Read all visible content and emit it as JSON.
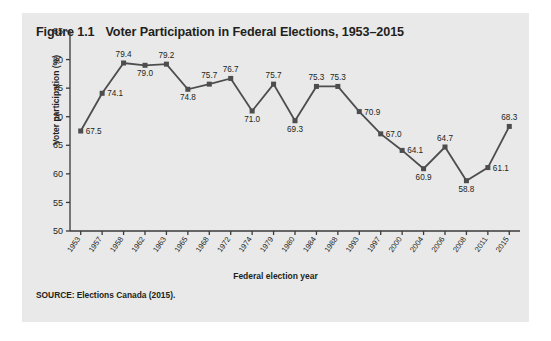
{
  "figure": {
    "number": "Figure 1.1",
    "title": "Voter Participation in Federal Elections, 1953–2015",
    "source_label": "SOURCE:",
    "source_text": "Elections Canada (2015)."
  },
  "chart_data": {
    "type": "line",
    "title": "Voter Participation in Federal Elections, 1953–2015",
    "subtitle": "",
    "xlabel": "Federal election year",
    "ylabel": "Voter participation (%)",
    "categories": [
      "1953",
      "1957",
      "1958",
      "1962",
      "1963",
      "1965",
      "1968",
      "1972",
      "1974",
      "1979",
      "1980",
      "1984",
      "1988",
      "1993",
      "1997",
      "2000",
      "2004",
      "2006",
      "2008",
      "2011",
      "2015"
    ],
    "values": [
      67.5,
      74.1,
      79.4,
      79.0,
      79.2,
      74.8,
      75.7,
      76.7,
      71.0,
      75.7,
      69.3,
      75.3,
      75.3,
      70.9,
      67.0,
      64.1,
      60.9,
      64.7,
      58.8,
      61.1,
      68.3
    ],
    "point_labels": [
      "67.5",
      "74.1",
      "79.4",
      "79.0",
      "79.2",
      "74.8",
      "75.7",
      "76.7",
      "71.0",
      "75.7",
      "69.3",
      "75.3",
      "75.3",
      "70.9",
      "67.0",
      "64.1",
      "60.9",
      "64.7",
      "58.8",
      "61.1",
      "68.3"
    ],
    "ylim": [
      50,
      85
    ],
    "yticks": [
      50,
      55,
      60,
      65,
      70,
      75,
      80,
      85
    ],
    "ytick_labels": [
      "50",
      "55",
      "60",
      "65",
      "70",
      "75",
      "80",
      "85"
    ],
    "grid": false,
    "legend": "none",
    "series_color": "#4d4d4d",
    "marker": "square",
    "panel_color": "#e9e9e9",
    "text_color": "#231f20"
  }
}
